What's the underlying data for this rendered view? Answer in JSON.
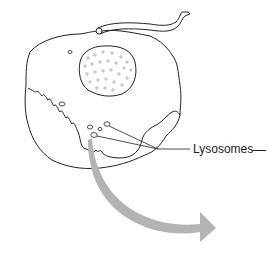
{
  "diagram": {
    "type": "cell-illustration",
    "labels": {
      "lysosomes": "Lysosomes"
    },
    "colors": {
      "stroke": "#222222",
      "arrow": "#b4b4b4",
      "background": "#ffffff",
      "nucleus_dots": "#888888"
    },
    "parts": [
      {
        "id": "cell-membrane",
        "name": "Cell body"
      },
      {
        "id": "nucleus",
        "name": "Nucleus (stippled)"
      },
      {
        "id": "flagellum",
        "name": "Flagellum / tail"
      },
      {
        "id": "ruffled-border",
        "name": "Wavy internal membrane"
      },
      {
        "id": "vesicles",
        "name": "Small vesicles"
      },
      {
        "id": "lysosomes",
        "name": "Lysosomes (labeled)"
      },
      {
        "id": "release-arrow",
        "name": "Large curved grey arrow"
      }
    ]
  }
}
